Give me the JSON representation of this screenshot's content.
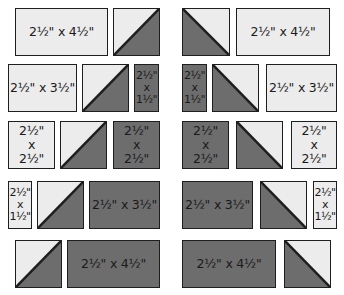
{
  "colors": {
    "light": "#ececec",
    "dark": "#6d6d6d",
    "border": "#1e1e1e"
  },
  "pieces": [
    {
      "id": "r1-l-rect",
      "type": "rect",
      "fill": "light",
      "x": 15,
      "y": 8,
      "w": 93,
      "h": 48,
      "label": "2½\" x 4½\""
    },
    {
      "id": "r1-l-hst",
      "type": "hst",
      "diag": "up",
      "x": 113,
      "y": 8,
      "w": 47,
      "h": 48
    },
    {
      "id": "r1-r-hst",
      "type": "hst",
      "diag": "down",
      "x": 182,
      "y": 8,
      "w": 48,
      "h": 48
    },
    {
      "id": "r1-r-rect",
      "type": "rect",
      "fill": "light",
      "x": 236,
      "y": 8,
      "w": 94,
      "h": 48,
      "label": "2½\" x 4½\""
    },
    {
      "id": "r2-l-rect",
      "type": "rect",
      "fill": "light",
      "x": 8,
      "y": 64,
      "w": 69,
      "h": 48,
      "label": "2½\" x 3½\""
    },
    {
      "id": "r2-l-hst",
      "type": "hst",
      "diag": "up",
      "x": 82,
      "y": 64,
      "w": 47,
      "h": 48
    },
    {
      "id": "r2-l-narrow",
      "type": "rect",
      "fill": "dark",
      "x": 134,
      "y": 64,
      "w": 25,
      "h": 48,
      "label": "2½\"\nx\n1½\"",
      "small": true
    },
    {
      "id": "r2-r-narrow",
      "type": "rect",
      "fill": "dark",
      "x": 182,
      "y": 64,
      "w": 25,
      "h": 48,
      "label": "2½\"\nx\n1½\"",
      "small": true
    },
    {
      "id": "r2-r-hst",
      "type": "hst",
      "diag": "down",
      "x": 212,
      "y": 64,
      "w": 47,
      "h": 48
    },
    {
      "id": "r2-r-rect",
      "type": "rect",
      "fill": "light",
      "x": 266,
      "y": 64,
      "w": 71,
      "h": 48,
      "label": "2½\" x 3½\""
    },
    {
      "id": "r3-l-sq1",
      "type": "rect",
      "fill": "light",
      "x": 8,
      "y": 121,
      "w": 47,
      "h": 48,
      "label": "2½\"\nx\n2½\""
    },
    {
      "id": "r3-l-hst",
      "type": "hst",
      "diag": "up",
      "x": 60,
      "y": 121,
      "w": 47,
      "h": 48
    },
    {
      "id": "r3-l-sq2",
      "type": "rect",
      "fill": "dark",
      "x": 113,
      "y": 121,
      "w": 47,
      "h": 48,
      "label": "2½\"\nx\n2½\""
    },
    {
      "id": "r3-r-sq1",
      "type": "rect",
      "fill": "dark",
      "x": 182,
      "y": 121,
      "w": 47,
      "h": 48,
      "label": "2½\"\nx\n2½\""
    },
    {
      "id": "r3-r-hst",
      "type": "hst",
      "diag": "down",
      "x": 236,
      "y": 121,
      "w": 47,
      "h": 48
    },
    {
      "id": "r3-r-sq2",
      "type": "rect",
      "fill": "light",
      "x": 291,
      "y": 121,
      "w": 46,
      "h": 48,
      "label": "2½\"\nx\n2½\""
    },
    {
      "id": "r4-l-narrow",
      "type": "rect",
      "fill": "light",
      "x": 8,
      "y": 181,
      "w": 24,
      "h": 48,
      "label": "2½\"\nx\n1½\"",
      "small": true
    },
    {
      "id": "r4-l-hst",
      "type": "hst",
      "diag": "up",
      "x": 37,
      "y": 181,
      "w": 47,
      "h": 48
    },
    {
      "id": "r4-l-rect",
      "type": "rect",
      "fill": "dark",
      "x": 89,
      "y": 181,
      "w": 71,
      "h": 48,
      "label": "2½\" x 3½\""
    },
    {
      "id": "r4-r-rect",
      "type": "rect",
      "fill": "dark",
      "x": 182,
      "y": 181,
      "w": 71,
      "h": 48,
      "label": "2½\" x 3½\""
    },
    {
      "id": "r4-r-hst",
      "type": "hst",
      "diag": "down",
      "x": 260,
      "y": 181,
      "w": 47,
      "h": 48
    },
    {
      "id": "r4-r-narrow",
      "type": "rect",
      "fill": "light",
      "x": 313,
      "y": 181,
      "w": 24,
      "h": 48,
      "label": "2½\"\nx\n1½\"",
      "small": true
    },
    {
      "id": "r5-l-hst",
      "type": "hst",
      "diag": "up",
      "x": 15,
      "y": 240,
      "w": 47,
      "h": 48
    },
    {
      "id": "r5-l-rect",
      "type": "rect",
      "fill": "dark",
      "x": 67,
      "y": 240,
      "w": 93,
      "h": 48,
      "label": "2½\" x 4½\""
    },
    {
      "id": "r5-r-rect",
      "type": "rect",
      "fill": "dark",
      "x": 182,
      "y": 240,
      "w": 94,
      "h": 48,
      "label": "2½\" x 4½\""
    },
    {
      "id": "r5-r-hst",
      "type": "hst",
      "diag": "down",
      "x": 284,
      "y": 240,
      "w": 47,
      "h": 48
    }
  ]
}
